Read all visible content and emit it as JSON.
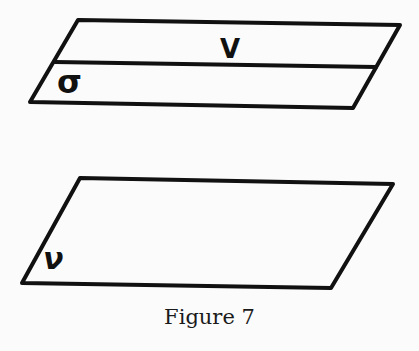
{
  "figure": {
    "caption": "Figure 7",
    "top_parallelogram": {
      "upper_region_label": "V",
      "lower_region_label": "σ"
    },
    "bottom_parallelogram": {
      "label": "ν"
    },
    "stroke_color": "#111111",
    "background_color": "#fbfbfb"
  }
}
